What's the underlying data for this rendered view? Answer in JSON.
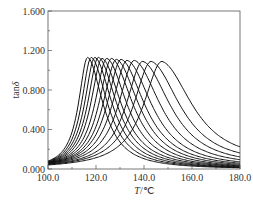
{
  "chart_data": {
    "type": "line",
    "title": "",
    "xlabel": "T/℃",
    "ylabel": "tanδ",
    "xlim": [
      100.0,
      180.0
    ],
    "ylim": [
      0.0,
      1.6
    ],
    "x_ticks": [
      "100.0",
      "120.0",
      "140.0",
      "160.0",
      "180.0"
    ],
    "y_ticks": [
      "0.000",
      "0.400",
      "0.800",
      "1.200",
      "1.600"
    ],
    "grid": false,
    "legend": null,
    "series": [
      {
        "name": "curve 1",
        "peak_x": 116.5,
        "peak_y": 1.13,
        "left_width": 5.0,
        "right_width": 7.5,
        "y_at_100": 0.05,
        "y_at_180": 0.0
      },
      {
        "name": "curve 2",
        "peak_x": 118.0,
        "peak_y": 1.13,
        "left_width": 5.3,
        "right_width": 8.0,
        "y_at_100": 0.05,
        "y_at_180": 0.0
      },
      {
        "name": "curve 3",
        "peak_x": 119.5,
        "peak_y": 1.13,
        "left_width": 5.6,
        "right_width": 8.5,
        "y_at_100": 0.04,
        "y_at_180": 0.0
      },
      {
        "name": "curve 4",
        "peak_x": 121.0,
        "peak_y": 1.13,
        "left_width": 5.9,
        "right_width": 9.0,
        "y_at_100": 0.04,
        "y_at_180": 0.0
      },
      {
        "name": "curve 5",
        "peak_x": 122.5,
        "peak_y": 1.12,
        "left_width": 6.2,
        "right_width": 9.5,
        "y_at_100": 0.04,
        "y_at_180": 0.01
      },
      {
        "name": "curve 6",
        "peak_x": 124.5,
        "peak_y": 1.12,
        "left_width": 6.6,
        "right_width": 10.0,
        "y_at_100": 0.03,
        "y_at_180": 0.01
      },
      {
        "name": "curve 7",
        "peak_x": 126.5,
        "peak_y": 1.12,
        "left_width": 7.0,
        "right_width": 10.6,
        "y_at_100": 0.03,
        "y_at_180": 0.01
      },
      {
        "name": "curve 8",
        "peak_x": 128.5,
        "peak_y": 1.11,
        "left_width": 7.4,
        "right_width": 11.2,
        "y_at_100": 0.03,
        "y_at_180": 0.02
      },
      {
        "name": "curve 9",
        "peak_x": 130.5,
        "peak_y": 1.11,
        "left_width": 7.8,
        "right_width": 11.8,
        "y_at_100": 0.03,
        "y_at_180": 0.03
      },
      {
        "name": "curve 10",
        "peak_x": 133.0,
        "peak_y": 1.1,
        "left_width": 8.3,
        "right_width": 12.5,
        "y_at_100": 0.02,
        "y_at_180": 0.04
      },
      {
        "name": "curve 11",
        "peak_x": 136.0,
        "peak_y": 1.1,
        "left_width": 8.8,
        "right_width": 13.3,
        "y_at_100": 0.02,
        "y_at_180": 0.06
      },
      {
        "name": "curve 12",
        "peak_x": 139.5,
        "peak_y": 1.09,
        "left_width": 9.3,
        "right_width": 14.2,
        "y_at_100": 0.02,
        "y_at_180": 0.08
      },
      {
        "name": "curve 13",
        "peak_x": 143.0,
        "peak_y": 1.09,
        "left_width": 9.8,
        "right_width": 15.0,
        "y_at_100": 0.02,
        "y_at_180": 0.12
      },
      {
        "name": "curve 14",
        "peak_x": 147.5,
        "peak_y": 1.09,
        "left_width": 10.3,
        "right_width": 16.0,
        "y_at_100": 0.02,
        "y_at_180": 0.17
      }
    ]
  },
  "axes": {
    "x_title_main": "T",
    "x_title_unit": "/℃",
    "y_title_main": "tan",
    "y_title_sym": "δ"
  },
  "colors": {
    "line": "#111111",
    "axis": "#555555",
    "background": "#ffffff"
  }
}
